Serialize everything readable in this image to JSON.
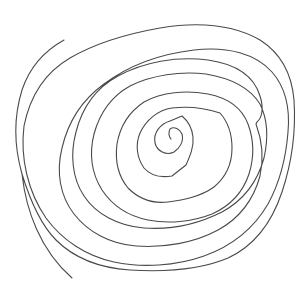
{
  "image": {
    "description": "Hand-drawn spiral line drawing on white background",
    "background_color": "#ffffff",
    "stroke_color": "#4a4a4a",
    "spiral": {
      "center": [
        170,
        140
      ],
      "approx_turns": 9,
      "direction": "outward clockwise, ending at bottom-left"
    }
  }
}
